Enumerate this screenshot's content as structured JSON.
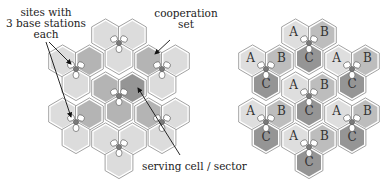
{
  "left_diagram": {
    "labels": {
      "sites": [
        "sites with",
        "3 base stations",
        "each"
      ],
      "cooperation": [
        "cooperation",
        "set"
      ],
      "serving": "serving cell / sector"
    },
    "colors": {
      "light": "#dcdcdc",
      "coop": "#b4b4b4",
      "serving": "#959595",
      "stroke": "#8a8a8a",
      "site_center": "#7a7a7a"
    }
  },
  "right_diagram": {
    "sector_labels": [
      "A",
      "B",
      "C"
    ],
    "colors": {
      "A": "#dedede",
      "B": "#bdbdbd",
      "C": "#959595"
    }
  }
}
